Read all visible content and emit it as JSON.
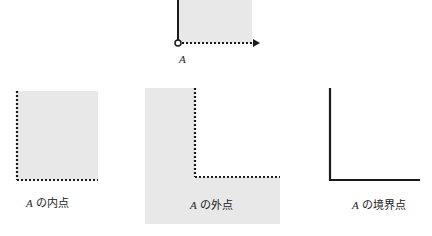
{
  "colors": {
    "fill": "#e8e8e8",
    "line": "#1a1a1a",
    "background": "#ffffff"
  },
  "top_figure": {
    "label": "A"
  },
  "figures": [
    {
      "id": "interior",
      "set_symbol": "A",
      "label_suffix": "の内点"
    },
    {
      "id": "exterior",
      "set_symbol": "A",
      "label_suffix": "の外点"
    },
    {
      "id": "boundary",
      "set_symbol": "A",
      "label_suffix": "の境界点"
    }
  ]
}
